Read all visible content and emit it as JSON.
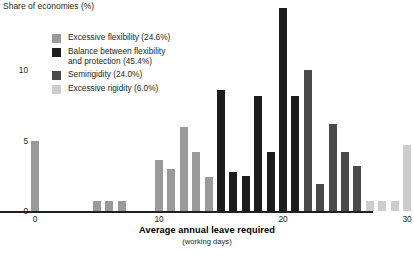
{
  "chart_data": {
    "type": "bar",
    "title": "",
    "ylabel": "Share of economies (%)",
    "xlabel": "Average annual leave required",
    "xlabel_sub": "(working days)",
    "ylim": [
      0,
      15
    ],
    "xlim": [
      -1.4,
      30.8
    ],
    "yticks": [
      0,
      5,
      10
    ],
    "ytick_labels": [
      "0",
      "5",
      "10"
    ],
    "xticks": [
      0,
      10,
      20,
      30
    ],
    "xtick_labels": [
      "0",
      "10",
      "20",
      "30"
    ],
    "grid": false,
    "legend_position": "upper-left-inside",
    "categories_note": "x = average annual leave required in working days",
    "series": [
      {
        "name": "Excessive flexibility",
        "share_label": "(24.6%)",
        "color": "#9a9a9a",
        "points": [
          {
            "x": 0,
            "y": 5.0
          },
          {
            "x": 5,
            "y": 0.7
          },
          {
            "x": 6,
            "y": 0.7
          },
          {
            "x": 7,
            "y": 0.7
          },
          {
            "x": 10,
            "y": 3.6
          },
          {
            "x": 11,
            "y": 3.0
          },
          {
            "x": 12,
            "y": 6.0
          },
          {
            "x": 13,
            "y": 4.2
          },
          {
            "x": 14,
            "y": 2.4
          }
        ]
      },
      {
        "name": "Balance between flexibility and protection",
        "share_label": "(45.4%)",
        "color": "#1c1c1c",
        "points": [
          {
            "x": 15,
            "y": 8.6
          },
          {
            "x": 16,
            "y": 2.8
          },
          {
            "x": 17,
            "y": 2.5
          },
          {
            "x": 18,
            "y": 8.2
          },
          {
            "x": 19,
            "y": 4.2
          },
          {
            "x": 20,
            "y": 14.4
          },
          {
            "x": 21,
            "y": 8.2
          }
        ]
      },
      {
        "name": "Semirigidity",
        "share_label": "(24.0%)",
        "color": "#4a4a4a",
        "points": [
          {
            "x": 22,
            "y": 10.0
          },
          {
            "x": 23,
            "y": 1.9
          },
          {
            "x": 24,
            "y": 6.2
          },
          {
            "x": 25,
            "y": 4.2
          },
          {
            "x": 26,
            "y": 3.2
          }
        ]
      },
      {
        "name": "Excessive rigidity",
        "share_label": "(6.0%)",
        "color": "#cdcdcd",
        "points": [
          {
            "x": 27,
            "y": 0.7
          },
          {
            "x": 28,
            "y": 0.7
          },
          {
            "x": 29,
            "y": 0.7
          },
          {
            "x": 30,
            "y": 4.7
          }
        ]
      }
    ]
  },
  "legend": {
    "items": [
      {
        "label": "Excessive flexibility  (24.6%)",
        "color": "#9a9a9a"
      },
      {
        "label": "Balance between flexibility\nand protection  (45.4%)",
        "color": "#1c1c1c"
      },
      {
        "label": "Semirigidity  (24.0%)",
        "color": "#4a4a4a"
      },
      {
        "label": "Excessive rigidity  (6.0%)",
        "color": "#cdcdcd"
      }
    ]
  }
}
